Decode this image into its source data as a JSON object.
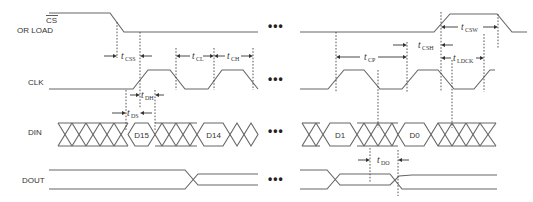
{
  "signals": {
    "cs": {
      "label_line1": "CS",
      "label_line2": "OR LOAD",
      "overline": true
    },
    "clk": {
      "label": "CLK"
    },
    "din": {
      "label": "DIN"
    },
    "dout": {
      "label": "DOUT"
    }
  },
  "data_bits": {
    "d15": "D15",
    "d14": "D14",
    "d1": "D1",
    "d0": "D0"
  },
  "timing_parameters": {
    "tcss": {
      "t": "t",
      "sub": "CSS"
    },
    "tcl": {
      "t": "t",
      "sub": "CL"
    },
    "tch": {
      "t": "t",
      "sub": "CH"
    },
    "tdh": {
      "t": "t",
      "sub": "DH"
    },
    "tds": {
      "t": "t",
      "sub": "DS"
    },
    "tcp": {
      "t": "t",
      "sub": "CP"
    },
    "tcsh": {
      "t": "t",
      "sub": "CSH"
    },
    "tcsw": {
      "t": "t",
      "sub": "CSW"
    },
    "tldck": {
      "t": "t",
      "sub": "LDCK"
    },
    "tdo": {
      "t": "t",
      "sub": "DO"
    }
  },
  "ellipsis": "•••",
  "colors": {
    "waveform": "#666666",
    "text": "#333333",
    "background": "#ffffff"
  }
}
